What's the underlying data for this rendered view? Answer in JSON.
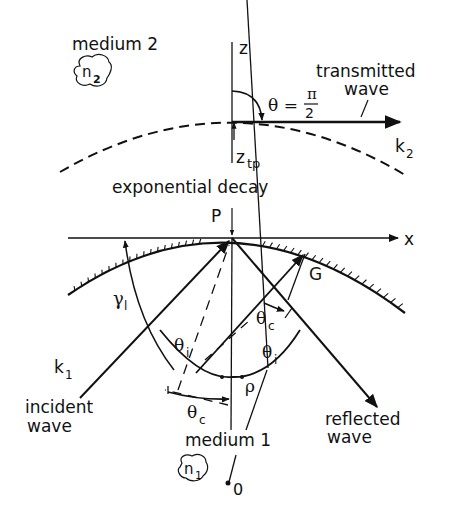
{
  "diagram": {
    "title": "",
    "colors": {
      "ink": "#111111",
      "background": "#ffffff"
    },
    "labels": {
      "medium2": "medium 2",
      "n2_main": "n",
      "n2_sub": "2",
      "z_axis": "z",
      "x_axis": "x",
      "theta_eq": "θ =",
      "pi": "π",
      "two": "2",
      "transmitted_line1": "transmitted",
      "transmitted_line2": "wave",
      "k2_main": "k",
      "k2_sub": "2",
      "ztp_main": "z",
      "ztp_sub": "tp",
      "exp_decay": "exponential decay",
      "P": "P",
      "G": "G",
      "gamma_main": "γ",
      "gamma_sub": "l",
      "theta_c_upper_main": "θ",
      "theta_c_upper_sub": "c",
      "theta_i_left_main": "θ",
      "theta_i_left_sub": "i",
      "theta_i_right_main": "θ",
      "theta_i_right_sub": "i",
      "theta_c_lower_main": "θ",
      "theta_c_lower_sub": "c",
      "rho": "ρ",
      "k1_main": "k",
      "k1_sub": "1",
      "incident_line1": "incident",
      "incident_line2": "wave",
      "reflected_line1": "reflected",
      "reflected_line2": "wave",
      "medium1": "medium 1",
      "n1_main": "n",
      "n1_sub": "1",
      "O": "0"
    }
  }
}
